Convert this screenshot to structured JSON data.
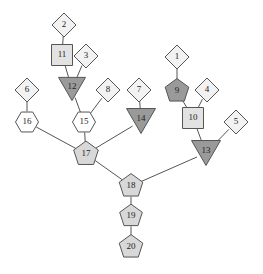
{
  "diagram": {
    "width": 263,
    "height": 274,
    "background": "#ffffff",
    "palette": {
      "light_fill": "#f2f2f2",
      "medium_fill": "#d8d8d8",
      "dark_fill": "#9a9a9a",
      "white_fill": "#ffffff",
      "stroke": "#555555",
      "label": "#222222",
      "edge": "#555555"
    },
    "shape_kinds": [
      "diamond",
      "square",
      "hexagon",
      "pentagon",
      "triangle-down"
    ],
    "nodes": [
      {
        "id": "n1",
        "label": "1",
        "shape": "diamond",
        "fill": "#f2f2f2",
        "x": 177,
        "y": 57,
        "size": 24
      },
      {
        "id": "n2",
        "label": "2",
        "shape": "diamond",
        "fill": "#f2f2f2",
        "x": 64,
        "y": 25,
        "size": 24
      },
      {
        "id": "n3",
        "label": "3",
        "shape": "diamond",
        "fill": "#f2f2f2",
        "x": 86,
        "y": 56,
        "size": 24
      },
      {
        "id": "n4",
        "label": "4",
        "shape": "diamond",
        "fill": "#f2f2f2",
        "x": 207,
        "y": 90,
        "size": 24
      },
      {
        "id": "n5",
        "label": "5",
        "shape": "diamond",
        "fill": "#f2f2f2",
        "x": 236,
        "y": 122,
        "size": 24
      },
      {
        "id": "n6",
        "label": "6",
        "shape": "diamond",
        "fill": "#f2f2f2",
        "x": 27,
        "y": 90,
        "size": 24
      },
      {
        "id": "n7",
        "label": "7",
        "shape": "diamond",
        "fill": "#f2f2f2",
        "x": 139,
        "y": 90,
        "size": 24
      },
      {
        "id": "n8",
        "label": "8",
        "shape": "diamond",
        "fill": "#f2f2f2",
        "x": 108,
        "y": 90,
        "size": 24
      },
      {
        "id": "n9",
        "label": "9",
        "shape": "pentagon",
        "fill": "#9a9a9a",
        "x": 177,
        "y": 91,
        "size": 23
      },
      {
        "id": "n10",
        "label": "10",
        "shape": "square",
        "fill": "#e2e2e2",
        "x": 193,
        "y": 118,
        "size": 21
      },
      {
        "id": "n11",
        "label": "11",
        "shape": "square",
        "fill": "#e2e2e2",
        "x": 62,
        "y": 55,
        "size": 21
      },
      {
        "id": "n12",
        "label": "12",
        "shape": "triangle-down",
        "fill": "#9a9a9a",
        "x": 72,
        "y": 89,
        "size": 27
      },
      {
        "id": "n13",
        "label": "13",
        "shape": "triangle-down",
        "fill": "#9a9a9a",
        "x": 206,
        "y": 153,
        "size": 29
      },
      {
        "id": "n14",
        "label": "14",
        "shape": "triangle-down",
        "fill": "#9a9a9a",
        "x": 141,
        "y": 121,
        "size": 29
      },
      {
        "id": "n15",
        "label": "15",
        "shape": "hexagon",
        "fill": "#ffffff",
        "x": 84,
        "y": 122,
        "size": 23
      },
      {
        "id": "n16",
        "label": "16",
        "shape": "hexagon",
        "fill": "#ffffff",
        "x": 27,
        "y": 122,
        "size": 23
      },
      {
        "id": "n17",
        "label": "17",
        "shape": "pentagon",
        "fill": "#d8d8d8",
        "x": 86,
        "y": 154,
        "size": 24
      },
      {
        "id": "n18",
        "label": "18",
        "shape": "pentagon",
        "fill": "#d8d8d8",
        "x": 131,
        "y": 186,
        "size": 23
      },
      {
        "id": "n19",
        "label": "19",
        "shape": "pentagon",
        "fill": "#d8d8d8",
        "x": 131,
        "y": 216,
        "size": 22
      },
      {
        "id": "n20",
        "label": "20",
        "shape": "pentagon",
        "fill": "#d8d8d8",
        "x": 131,
        "y": 247,
        "size": 23
      }
    ],
    "edges": [
      {
        "source": "n2",
        "target": "n11"
      },
      {
        "source": "n11",
        "target": "n12"
      },
      {
        "source": "n3",
        "target": "n12"
      },
      {
        "source": "n12",
        "target": "n15"
      },
      {
        "source": "n6",
        "target": "n16"
      },
      {
        "source": "n8",
        "target": "n15"
      },
      {
        "source": "n16",
        "target": "n17"
      },
      {
        "source": "n15",
        "target": "n17"
      },
      {
        "source": "n7",
        "target": "n14"
      },
      {
        "source": "n14",
        "target": "n17"
      },
      {
        "source": "n17",
        "target": "n18"
      },
      {
        "source": "n1",
        "target": "n9"
      },
      {
        "source": "n9",
        "target": "n10"
      },
      {
        "source": "n4",
        "target": "n10"
      },
      {
        "source": "n10",
        "target": "n13"
      },
      {
        "source": "n5",
        "target": "n13"
      },
      {
        "source": "n13",
        "target": "n18"
      },
      {
        "source": "n18",
        "target": "n19"
      },
      {
        "source": "n19",
        "target": "n20"
      }
    ]
  }
}
